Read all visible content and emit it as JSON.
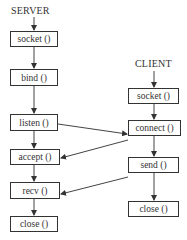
{
  "server": {
    "title": "SERVER",
    "steps": [
      {
        "label": "socket ()"
      },
      {
        "label": "bind ()"
      },
      {
        "label": "listen ()"
      },
      {
        "label": "accept ()"
      },
      {
        "label": "recv ()"
      },
      {
        "label": "close ()"
      }
    ]
  },
  "client": {
    "title": "CLIENT",
    "steps": [
      {
        "label": "socket ()"
      },
      {
        "label": "connect ()"
      },
      {
        "label": "send ()"
      },
      {
        "label": "close ()"
      }
    ]
  },
  "connections": [
    {
      "from": "server.listen ()",
      "to": "client.connect ()"
    },
    {
      "from": "client.connect ()",
      "to": "server.accept ()"
    },
    {
      "from": "client.send ()",
      "to": "server.recv ()"
    }
  ]
}
